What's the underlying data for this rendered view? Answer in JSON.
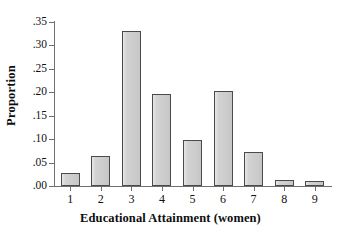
{
  "chart_data": {
    "type": "bar",
    "title": "",
    "xlabel": "Educational Attainment (women)",
    "ylabel": "Proportion",
    "categories": [
      "1",
      "2",
      "3",
      "4",
      "5",
      "6",
      "7",
      "8",
      "9"
    ],
    "values": [
      0.028,
      0.063,
      0.331,
      0.196,
      0.098,
      0.202,
      0.072,
      0.012,
      0.01
    ],
    "ylim": [
      0.0,
      0.35
    ],
    "ytick_values": [
      0.0,
      0.05,
      0.1,
      0.15,
      0.2,
      0.25,
      0.3,
      0.35
    ],
    "ytick_labels": [
      ".00",
      ".05",
      ".10",
      ".15",
      ".20",
      ".25",
      ".30",
      ".35"
    ],
    "grid": false,
    "legend": null,
    "bar_fill_color": "#d2d2d2",
    "bar_edge_color": "#4a4a4a",
    "axis_color": "#6f6f6f",
    "background_color": "#ffffff"
  }
}
